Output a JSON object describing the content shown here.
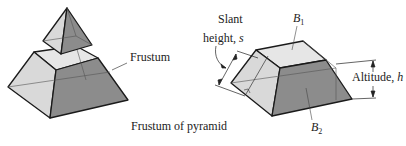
{
  "left_figure": {
    "callout_label": "Frustum",
    "caption": "Frustum of pyramid"
  },
  "right_figure": {
    "top_base_label": "B",
    "top_base_subscript": "1",
    "bottom_base_label": "B",
    "bottom_base_subscript": "2",
    "slant_label_line1": "Slant",
    "slant_label_line2": "height, ",
    "slant_var": "s",
    "altitude_label": "Altitude, ",
    "altitude_var": "h"
  },
  "colors": {
    "background": "#ffffff",
    "edge": "#1a1a1a",
    "light_face": "#d9d9d9",
    "top_face": "#e6e6e6",
    "dark_face": "#8c8c8c",
    "mid_face": "#b8b8b8"
  }
}
